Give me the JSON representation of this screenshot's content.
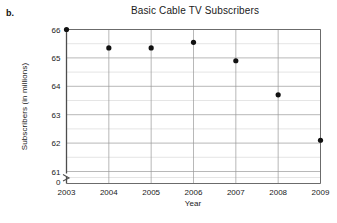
{
  "part_label": "b.",
  "chart_data": {
    "type": "scatter",
    "title": "Basic Cable TV Subscribers",
    "xlabel": "Year",
    "ylabel": "Subscribers (in millions)",
    "x": [
      2003,
      2004,
      2005,
      2006,
      2007,
      2008,
      2009
    ],
    "values": [
      66.0,
      65.35,
      65.35,
      65.55,
      64.9,
      63.7,
      62.1
    ],
    "categories": [
      "2003",
      "2004",
      "2005",
      "2006",
      "2007",
      "2008",
      "2009"
    ],
    "xtick_labels": [
      "2003",
      "2004",
      "2005",
      "2006",
      "2007",
      "2008",
      "2009"
    ],
    "ytick_labels": [
      "66",
      "65",
      "64",
      "63",
      "62",
      "61",
      "0"
    ],
    "ytick_values": [
      66,
      65,
      64,
      63,
      62,
      61
    ],
    "y_minor_ticks": [
      65.5,
      64.5,
      63.5,
      62.5,
      61.5
    ],
    "xlim": [
      2003,
      2009
    ],
    "ylim": [
      61,
      66
    ],
    "y_axis_break": true,
    "y_axis_break_label": "0",
    "grid": true,
    "legend": false,
    "marker": "filled-circle",
    "marker_color": "#111111",
    "series_name": "Basic cable TV subscribers"
  }
}
